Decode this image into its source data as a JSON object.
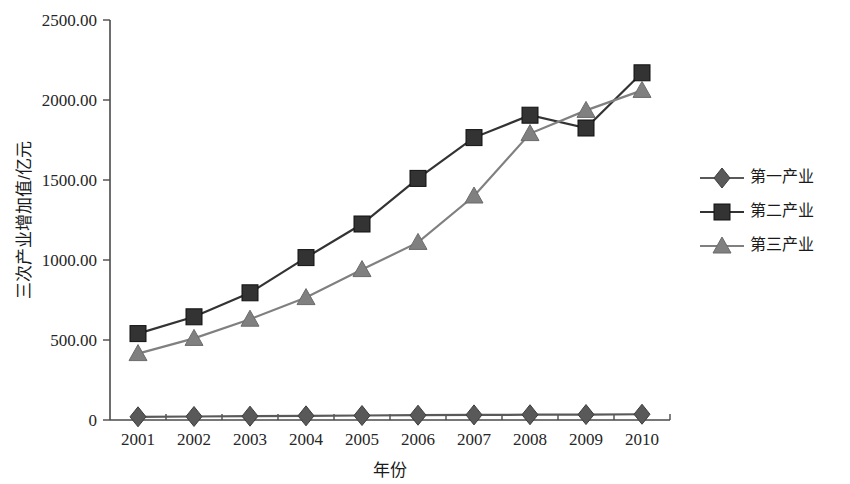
{
  "chart_data": {
    "type": "line",
    "title": "",
    "xlabel": "年份",
    "ylabel": "三次产业增加值/亿元",
    "x": [
      "2001",
      "2002",
      "2003",
      "2004",
      "2005",
      "2006",
      "2007",
      "2008",
      "2009",
      "2010"
    ],
    "categories": [
      "2001",
      "2002",
      "2003",
      "2004",
      "2005",
      "2006",
      "2007",
      "2008",
      "2009",
      "2010"
    ],
    "series": [
      {
        "name": "第一产业",
        "marker": "diamond",
        "color": "#595959",
        "values": [
          20,
          22,
          24,
          26,
          28,
          30,
          32,
          33,
          34,
          36
        ]
      },
      {
        "name": "第二产业",
        "marker": "square",
        "color": "#333333",
        "values": [
          540,
          645,
          795,
          1015,
          1225,
          1510,
          1765,
          1905,
          1825,
          2170
        ]
      },
      {
        "name": "第三产业",
        "marker": "triangle",
        "color": "#808080",
        "values": [
          415,
          510,
          630,
          765,
          940,
          1110,
          1400,
          1790,
          1935,
          2060
        ]
      }
    ],
    "ylim": [
      0,
      2500
    ],
    "yticks": [
      0,
      500,
      1000,
      1500,
      2000,
      2500
    ],
    "ytick_labels": [
      "0",
      "500.00",
      "1000.00",
      "1500.00",
      "2000.00",
      "2500.00"
    ],
    "grid": false,
    "legend_position": "right"
  },
  "legend": {
    "items": [
      {
        "label": "第一产业"
      },
      {
        "label": "第二产业"
      },
      {
        "label": "第三产业"
      }
    ]
  }
}
